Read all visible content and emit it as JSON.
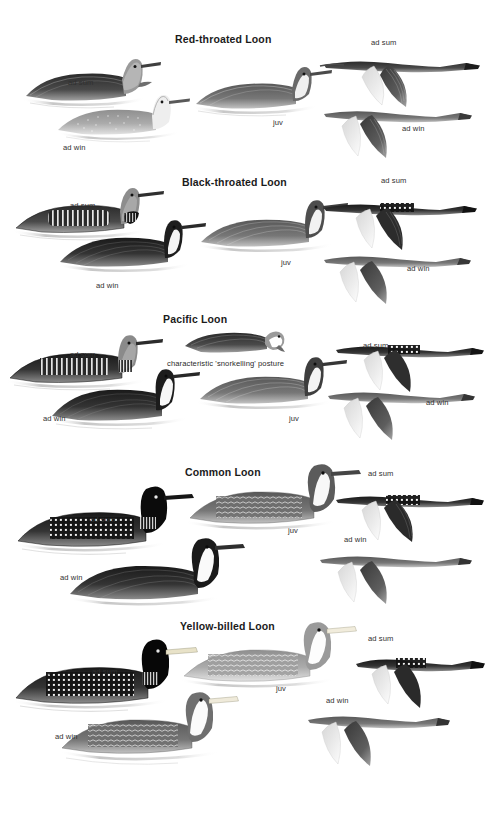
{
  "page": {
    "kind": "field-guide-plate",
    "background_color": "#ffffff",
    "width": 485,
    "height": 815,
    "ink_dark": "#1b1b1b",
    "ink_mid": "#5a5a5a",
    "ink_light": "#b4b4b4",
    "label_color": "#303030"
  },
  "labels": {
    "adult_summer": "ad sum",
    "adult_winter": "ad win",
    "juvenile": "juv"
  },
  "sections": [
    {
      "id": "red-throated-loon",
      "title": "Red-throated Loon",
      "title_x": 175,
      "title_y": 33,
      "top": 20,
      "height": 148,
      "notes": [],
      "figures": [
        {
          "name": "ad-sum-swimming",
          "label": "ad sum",
          "label_x": 68,
          "label_y": 82,
          "pose": "swim-left-head-up",
          "tone": "dark-grey",
          "fig_x": 22,
          "fig_y": 52,
          "fig_w": 140,
          "fig_h": 58
        },
        {
          "name": "ad-win-swimming",
          "label": "ad win",
          "label_x": 63,
          "label_y": 145,
          "pose": "swim-left-pale",
          "tone": "pale",
          "fig_x": 56,
          "fig_y": 92,
          "fig_w": 135,
          "fig_h": 52
        },
        {
          "name": "juv-swimming",
          "label": "juv",
          "label_x": 273,
          "label_y": 122,
          "pose": "swim-left-head-up",
          "tone": "mid-grey",
          "fig_x": 192,
          "fig_y": 62,
          "fig_w": 140,
          "fig_h": 58
        },
        {
          "name": "ad-sum-flight",
          "label": "ad sum",
          "label_x": 371,
          "label_y": 38,
          "pose": "flight-right",
          "tone": "dark-grey",
          "fig_x": 318,
          "fig_y": 45,
          "fig_w": 160,
          "fig_h": 62
        },
        {
          "name": "ad-win-flight",
          "label": "ad win",
          "label_x": 402,
          "label_y": 128,
          "pose": "flight-right",
          "tone": "mid-grey",
          "fig_x": 316,
          "fig_y": 98,
          "fig_w": 150,
          "fig_h": 60
        }
      ]
    },
    {
      "id": "black-throated-loon",
      "title": "Black-throated Loon",
      "title_x": 182,
      "title_y": 176,
      "top": 166,
      "height": 140,
      "notes": [],
      "figures": [
        {
          "name": "ad-sum-swimming",
          "label": "ad sum",
          "label_x": 70,
          "label_y": 205,
          "pose": "swim-left-barred",
          "tone": "dark-grey",
          "fig_x": 12,
          "fig_y": 182,
          "fig_w": 152,
          "fig_h": 62
        },
        {
          "name": "ad-win-swimming",
          "label": "ad win",
          "label_x": 96,
          "label_y": 285,
          "pose": "swim-left-dark",
          "tone": "dark",
          "fig_x": 58,
          "fig_y": 218,
          "fig_w": 150,
          "fig_h": 62
        },
        {
          "name": "juv-swimming",
          "label": "juv",
          "label_x": 281,
          "label_y": 262,
          "pose": "swim-left-dark",
          "tone": "mid-grey",
          "fig_x": 197,
          "fig_y": 196,
          "fig_w": 152,
          "fig_h": 64
        },
        {
          "name": "ad-sum-flight",
          "label": "ad sum",
          "label_x": 381,
          "label_y": 180,
          "pose": "flight-right-barred",
          "tone": "dark",
          "fig_x": 318,
          "fig_y": 186,
          "fig_w": 158,
          "fig_h": 62
        },
        {
          "name": "ad-win-flight",
          "label": "ad win",
          "label_x": 407,
          "label_y": 268,
          "pose": "flight-right",
          "tone": "mid-grey",
          "fig_x": 316,
          "fig_y": 242,
          "fig_w": 152,
          "fig_h": 60
        }
      ]
    },
    {
      "id": "pacific-loon",
      "title": "Pacific Loon",
      "title_x": 163,
      "title_y": 313,
      "top": 306,
      "height": 146,
      "notes": [
        {
          "name": "snorkelling-posture-note",
          "text": "characteristic 'snorkelling' posture",
          "x": 167,
          "y": 363
        }
      ],
      "figures": [
        {
          "name": "ad-sum-swimming",
          "label": "ad sum",
          "label_x": 70,
          "label_y": 354,
          "pose": "swim-left-barred",
          "tone": "dark",
          "fig_x": 6,
          "fig_y": 330,
          "fig_w": 158,
          "fig_h": 64
        },
        {
          "name": "snorkelling-posture",
          "label": "",
          "label_x": 0,
          "label_y": 0,
          "pose": "snorkelling",
          "tone": "dark-grey",
          "fig_x": 183,
          "fig_y": 328,
          "fig_w": 105,
          "fig_h": 35
        },
        {
          "name": "ad-win-swimming",
          "label": "ad win",
          "label_x": 43,
          "label_y": 418,
          "pose": "swim-left-dark",
          "tone": "dark",
          "fig_x": 50,
          "fig_y": 368,
          "fig_w": 152,
          "fig_h": 66
        },
        {
          "name": "juv-swimming",
          "label": "juv",
          "label_x": 289,
          "label_y": 418,
          "pose": "swim-left-dark",
          "tone": "mid-grey",
          "fig_x": 196,
          "fig_y": 355,
          "fig_w": 152,
          "fig_h": 62
        },
        {
          "name": "ad-sum-flight",
          "label": "ad sum",
          "label_x": 363,
          "label_y": 345,
          "pose": "flight-right-barred",
          "tone": "dark",
          "fig_x": 330,
          "fig_y": 330,
          "fig_w": 152,
          "fig_h": 60
        },
        {
          "name": "ad-win-flight",
          "label": "ad win",
          "label_x": 426,
          "label_y": 402,
          "pose": "flight-right",
          "tone": "mid-grey",
          "fig_x": 320,
          "fig_y": 378,
          "fig_w": 152,
          "fig_h": 62
        }
      ]
    },
    {
      "id": "common-loon",
      "title": "Common Loon",
      "title_x": 185,
      "title_y": 466,
      "top": 453,
      "height": 158,
      "notes": [],
      "figures": [
        {
          "name": "ad-sum-swimming",
          "label": "ad sum",
          "label_x": 90,
          "label_y": 519,
          "pose": "swim-left-checkered",
          "tone": "black",
          "fig_x": 14,
          "fig_y": 483,
          "fig_w": 178,
          "fig_h": 78
        },
        {
          "name": "ad-win-swimming",
          "label": "ad win",
          "label_x": 60,
          "label_y": 577,
          "pose": "swim-left-dark",
          "tone": "dark",
          "fig_x": 68,
          "fig_y": 538,
          "fig_w": 172,
          "fig_h": 74
        },
        {
          "name": "juv-swimming",
          "label": "juv",
          "label_x": 288,
          "label_y": 530,
          "pose": "swim-left-scaled",
          "tone": "mid-grey",
          "fig_x": 186,
          "fig_y": 464,
          "fig_w": 170,
          "fig_h": 72
        },
        {
          "name": "ad-sum-flight",
          "label": "ad sum",
          "label_x": 368,
          "label_y": 473,
          "pose": "flight-right-barred",
          "tone": "dark",
          "fig_x": 330,
          "fig_y": 478,
          "fig_w": 152,
          "fig_h": 64
        },
        {
          "name": "ad-win-flight",
          "label": "ad win",
          "label_x": 344,
          "label_y": 539,
          "pose": "flight-right",
          "tone": "mid-grey",
          "fig_x": 312,
          "fig_y": 540,
          "fig_w": 158,
          "fig_h": 64
        }
      ]
    },
    {
      "id": "yellow-billed-loon",
      "title": "Yellow-billed Loon",
      "title_x": 180,
      "title_y": 620,
      "top": 612,
      "height": 168,
      "notes": [],
      "figures": [
        {
          "name": "ad-sum-swimming",
          "label": "ad sum",
          "label_x": 92,
          "label_y": 671,
          "pose": "swim-left-checkered",
          "tone": "black",
          "fig_x": 12,
          "fig_y": 638,
          "fig_w": 182,
          "fig_h": 80
        },
        {
          "name": "ad-win-swimming",
          "label": "ad win",
          "label_x": 55,
          "label_y": 736,
          "pose": "swim-left-scaled",
          "tone": "mid-grey",
          "fig_x": 60,
          "fig_y": 692,
          "fig_w": 175,
          "fig_h": 76
        },
        {
          "name": "juv-swimming",
          "label": "juv",
          "label_x": 276,
          "label_y": 688,
          "pose": "swim-left-scaled",
          "tone": "pale-grey",
          "fig_x": 180,
          "fig_y": 622,
          "fig_w": 172,
          "fig_h": 76
        },
        {
          "name": "ad-sum-flight",
          "label": "ad sum",
          "label_x": 368,
          "label_y": 638,
          "pose": "flight-right-barred",
          "tone": "dark",
          "fig_x": 352,
          "fig_y": 642,
          "fig_w": 132,
          "fig_h": 66
        },
        {
          "name": "ad-win-flight",
          "label": "ad win",
          "label_x": 326,
          "label_y": 700,
          "pose": "flight-right",
          "tone": "mid-grey",
          "fig_x": 300,
          "fig_y": 700,
          "fig_w": 148,
          "fig_h": 66
        }
      ]
    }
  ]
}
